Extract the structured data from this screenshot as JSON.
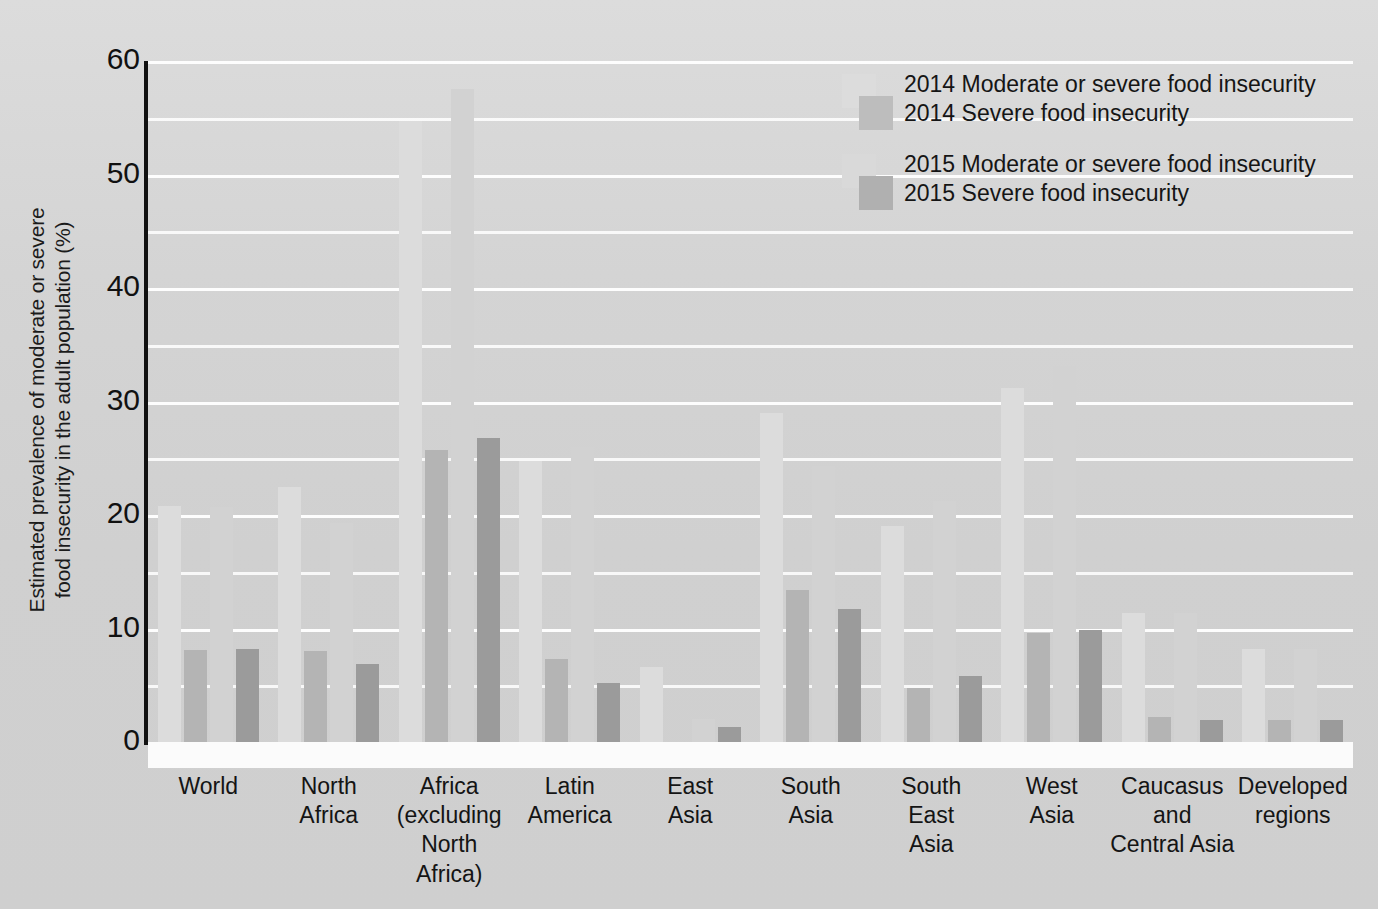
{
  "chart_data": {
    "type": "bar",
    "title": "",
    "xlabel": "",
    "ylabel": "Estimated prevalence of moderate or severe\nfood insecurity in the adult population (%)",
    "ylim": [
      0,
      60
    ],
    "yticks": [
      0,
      10,
      20,
      30,
      40,
      50,
      60
    ],
    "ytick_labels": [
      "0",
      "10",
      "20",
      "30",
      "40",
      "50",
      "60"
    ],
    "minor_gridline_step": 5,
    "grid": true,
    "legend_position": "top-right",
    "categories": [
      "World",
      "North\nAfrica",
      "Africa\n(excluding\nNorth\nAfrica)",
      "Latin\nAmerica",
      "East\nAsia",
      "South\nAsia",
      "South\nEast\nAsia",
      "West\nAsia",
      "Caucasus\nand\nCentral Asia",
      "Developed\nregions"
    ],
    "series": [
      {
        "name": "2014 Moderate or severe food insecurity",
        "color": "#dcdcdc",
        "values": [
          20.8,
          22.5,
          54.7,
          24.8,
          6.6,
          29.0,
          19.0,
          31.2,
          11.4,
          8.2
        ]
      },
      {
        "name": "2014 Severe food insecurity",
        "color": "#b4b4b4",
        "values": [
          8.1,
          8.0,
          25.7,
          7.3,
          0.0,
          13.4,
          4.8,
          9.6,
          2.2,
          1.9
        ]
      },
      {
        "name": "2015 Moderate or severe food insecurity",
        "color": "#d2d2d2",
        "values": [
          20.7,
          19.3,
          57.5,
          26.0,
          2.0,
          24.3,
          21.2,
          33.1,
          11.4,
          8.2
        ]
      },
      {
        "name": "2015 Severe food insecurity",
        "color": "#9b9b9b",
        "values": [
          8.2,
          6.9,
          26.8,
          5.2,
          1.3,
          11.7,
          5.8,
          9.9,
          1.9,
          1.9
        ]
      }
    ]
  },
  "legend": {
    "groups": [
      {
        "swatch_light": "#dcdcdc",
        "swatch_dark": "#bdbdbd",
        "line1": "2014 Moderate or severe food insecurity",
        "line2": "2014 Severe food insecurity"
      },
      {
        "swatch_light": "#d9d9d9",
        "swatch_dark": "#b0b0b0",
        "line1": "2015 Moderate or severe food insecurity",
        "line2": "2015 Severe food insecurity"
      }
    ]
  }
}
